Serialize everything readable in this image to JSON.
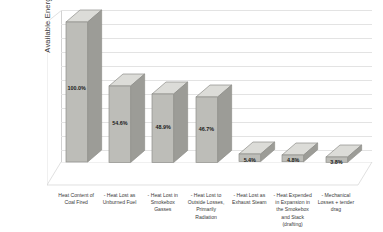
{
  "chart_data": {
    "type": "bar",
    "title": "",
    "subtitle": "",
    "xlabel": "",
    "ylabel": "Available Energy",
    "ylim": [
      0,
      100
    ],
    "grid": true,
    "legend": false,
    "style_3d": true,
    "value_label_suffix": "%",
    "categories": [
      "Heat Content of Coal Fired",
      "- Heat Lost as Unburned Fuel",
      "- Heat Lost in Smokebox Gasses",
      "- Heat Lost to Outside Losses, Primarily Radiation",
      "- Heat Lost as Exhaust Steam",
      "- Heat Expended in Expansion in the Smokebox and Stack (drafting)",
      "- Mechanical Losses + tender drag"
    ],
    "values": [
      100.0,
      54.6,
      48.9,
      46.7,
      5.4,
      4.8,
      3.8
    ],
    "value_labels": [
      "100.0%",
      "54.6%",
      "48.9%",
      "46.7%",
      "5.4%",
      "4.8%",
      "3.8%"
    ],
    "yticks": [
      0,
      10,
      20,
      30,
      40,
      50,
      60,
      70,
      80,
      90,
      100
    ],
    "ytick_labels": [
      "0.0%",
      "10.0%",
      "20.0%",
      "30.0%",
      "40.0%",
      "50.0%",
      "60.0%",
      "70.0%",
      "80.0%",
      "90.0%",
      "100.0%"
    ],
    "colors": {
      "bar_face": "#bdbdb8",
      "bar_top": "#dcdcd8",
      "bar_side": "#9c9c97",
      "bar_outline": "#8e8e89",
      "gridline": "#e3e3e3",
      "axis": "#d2d2d2",
      "plot_background": "#ffffff",
      "text": "#3a3a3a",
      "value_text": "#1a1a1a"
    }
  }
}
